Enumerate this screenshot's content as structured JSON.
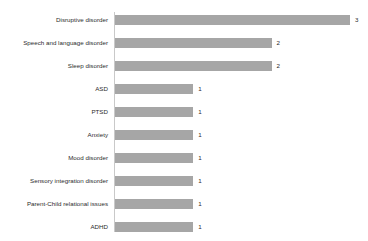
{
  "chart_data": {
    "type": "bar",
    "orientation": "horizontal",
    "title": "",
    "subtitle": "",
    "xlabel": "",
    "ylabel": "",
    "categories": [
      "Disruptive disorder",
      "Speech and language disorder",
      "Sleep disorder",
      "ASD",
      "PTSD",
      "Anxiety",
      "Mood disorder",
      "Sensory integration disorder",
      "Parent-Child relational issues",
      "ADHD"
    ],
    "values": [
      3,
      2,
      2,
      1,
      1,
      1,
      1,
      1,
      1,
      1
    ],
    "value_labels": [
      "3",
      "2",
      "2",
      "1",
      "1",
      "1",
      "1",
      "1",
      "1",
      "1"
    ],
    "xlim": [
      0,
      3.25
    ],
    "grid": false,
    "legend": false,
    "legend_position": "none",
    "tick_labels_x": [],
    "bar_color": "#a6a6a6",
    "axis_color": "#c9c9c9",
    "text_color": "#2b2b2b",
    "background_color": "#ffffff"
  }
}
